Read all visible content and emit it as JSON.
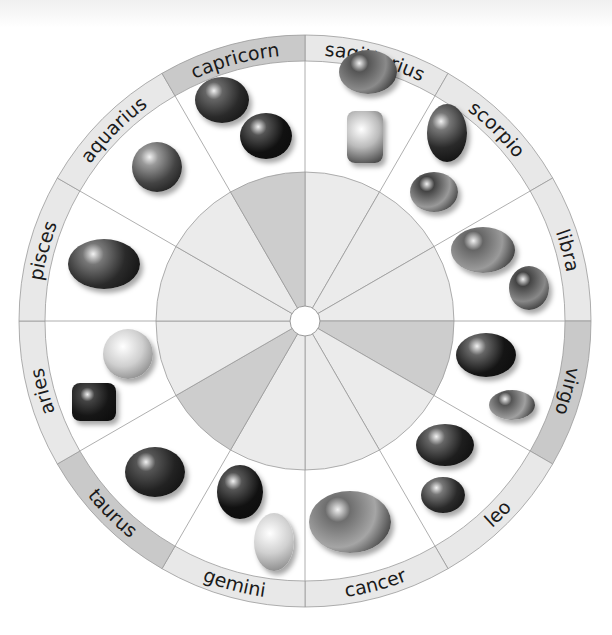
{
  "diagram": {
    "type": "zodiac-birthstone-wheel",
    "center": [
      305,
      321
    ],
    "colors": {
      "ring_light": "#e8e8e8",
      "ring_dark": "#c9c9c9",
      "pie_light": "#ebebeb",
      "pie_dark": "#cdcdcd",
      "lines": "#9a9a9a",
      "text": "#1a1a1a"
    },
    "signs": [
      {
        "name": "sagittarius",
        "highlight": false,
        "gems": [
          "turquoise",
          "zircon"
        ]
      },
      {
        "name": "scorpio",
        "highlight": false,
        "gems": [
          "agate",
          "turquoise"
        ]
      },
      {
        "name": "libra",
        "highlight": false,
        "gems": [
          "rough crystal",
          "faceted oval"
        ]
      },
      {
        "name": "virgo",
        "highlight": true,
        "gems": [
          "tumbled agate",
          "cabochon"
        ]
      },
      {
        "name": "leo",
        "highlight": false,
        "gems": [
          "tiger's eye",
          "cat's eye"
        ]
      },
      {
        "name": "cancer",
        "highlight": false,
        "gems": [
          "moonstone"
        ]
      },
      {
        "name": "gemini",
        "highlight": false,
        "gems": [
          "tumbled stone",
          "oval crystal"
        ]
      },
      {
        "name": "taurus",
        "highlight": true,
        "gems": [
          "oval sapphire"
        ]
      },
      {
        "name": "aries",
        "highlight": false,
        "gems": [
          "round diamond",
          "emerald cut"
        ]
      },
      {
        "name": "pisces",
        "highlight": false,
        "gems": [
          "oval amethyst"
        ]
      },
      {
        "name": "aquarius",
        "highlight": false,
        "gems": [
          "cushion garnet"
        ]
      },
      {
        "name": "capricorn",
        "highlight": true,
        "gems": [
          "oval garnet",
          "tumbled stone"
        ]
      }
    ]
  }
}
